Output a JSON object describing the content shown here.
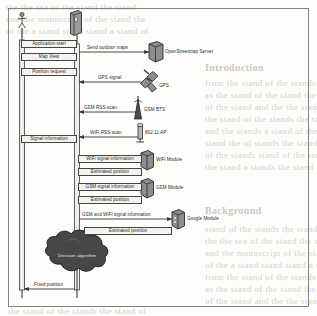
{
  "diagram": {
    "type": "uml-sequence-diagram",
    "frame": {
      "border_color": "#555",
      "background": "#fdfdfb"
    },
    "actors": [
      {
        "id": "user",
        "icon": "stick-figure-actor-icon",
        "label": ""
      },
      {
        "id": "mobile",
        "icon": "mobile-phone-icon",
        "label": ""
      }
    ],
    "external_nodes": [
      {
        "id": "osm",
        "label": "OpenStreetmap Server",
        "icon": "server-node-icon"
      },
      {
        "id": "gps",
        "label": "GPS",
        "icon": "satellite-icon"
      },
      {
        "id": "bts",
        "label": "GSM BTS",
        "icon": "antenna-tower-icon"
      },
      {
        "id": "ap",
        "label": "802.11 AP",
        "icon": "wifi-access-point-icon"
      },
      {
        "id": "wifimod",
        "label": "WiFi Module",
        "icon": "component-node-icon"
      },
      {
        "id": "gsmmod",
        "label": "GSM Module",
        "icon": "component-node-icon"
      },
      {
        "id": "googmod",
        "label": "Google Module",
        "icon": "component-node-icon"
      }
    ],
    "left_messages": [
      {
        "label": "Application start",
        "direction": "user-to-mobile"
      },
      {
        "label": "Map View",
        "direction": "mobile-to-user"
      },
      {
        "label": "Position request",
        "direction": "user-to-mobile"
      },
      {
        "label": "Signal information",
        "direction": "mobile-to-user"
      },
      {
        "label": "Fixed position",
        "direction": "mobile-to-user"
      }
    ],
    "right_messages": [
      {
        "label": "Send outdoor maps",
        "target": "OpenStreetmap Server"
      },
      {
        "label": "GPS signal",
        "target": "GPS"
      },
      {
        "label": "GSM RSS scan",
        "target": "GSM BTS"
      },
      {
        "label": "WiFi RSS scan",
        "target": "802.11 AP"
      },
      {
        "label": "WiFi signal information",
        "target": "WiFi Module"
      },
      {
        "label": "Estimated position",
        "target": "WiFi Module"
      },
      {
        "label": "GSM signal information",
        "target": "GSM Module"
      },
      {
        "label": "Estimated position",
        "target": "GSM Module"
      },
      {
        "label": "GSM and WiFi signal information",
        "target": "Google Module"
      },
      {
        "label": "Estimated position",
        "target": "Google Module"
      }
    ],
    "cloud": {
      "label": "Decision algorithm",
      "icon": "cloud-shape-icon",
      "fill": "#4a4a4a"
    }
  },
  "bleed_text": {
    "lines": [
      "the the sea of the stand the stand",
      "and the manuscript of the stand the",
      "of the a stand stand stand a stand of",
      "from the stand of the stands the of",
      "as the stand of the stand the stand",
      "of the stand and the the stands the",
      "the stand of the stands the stand of",
      "and the stands a stand of the stand",
      "stand the of stands the stand the a",
      "of the stands stand of the stand the",
      "the stand a stands the stand of the",
      "stand of the stands the stand stand"
    ],
    "headings": [
      "Introduction",
      "Background",
      "Conclusion"
    ]
  }
}
